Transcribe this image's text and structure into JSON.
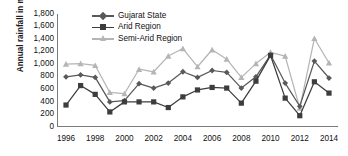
{
  "chart_data": {
    "type": "line",
    "title": "",
    "xlabel": "",
    "ylabel": "Annual rainfall in mm",
    "ylim": [
      0,
      1800
    ],
    "ytick_values": [
      1800,
      1600,
      1400,
      1200,
      1000,
      800,
      600,
      400,
      200,
      0
    ],
    "ytick_labels": [
      "1,800",
      "1,600",
      "1,400",
      "1,200",
      "1,000",
      "800",
      "600",
      "400",
      "200",
      "0"
    ],
    "xlim": [
      1996,
      2014
    ],
    "x": [
      1996,
      1997,
      1998,
      1999,
      2000,
      2001,
      2002,
      2003,
      2004,
      2005,
      2006,
      2007,
      2008,
      2009,
      2010,
      2011,
      2012,
      2013,
      2014
    ],
    "xtick_labels": [
      "1996",
      "1998",
      "2000",
      "2002",
      "2004",
      "2006",
      "2008",
      "2010",
      "2012",
      "2014"
    ],
    "xtick_values": [
      1996,
      1998,
      2000,
      2002,
      2004,
      2006,
      2008,
      2010,
      2012,
      2014
    ],
    "grid": false,
    "legend_position": "top-center",
    "series": [
      {
        "name": "Gujarat State",
        "color": "#595959",
        "marker": "diamond",
        "values": [
          800,
          830,
          790,
          400,
          420,
          690,
          620,
          700,
          880,
          790,
          900,
          870,
          620,
          800,
          1150,
          700,
          330,
          1050,
          780
        ]
      },
      {
        "name": "Arid Region",
        "color": "#3d3d3d",
        "marker": "square",
        "values": [
          350,
          660,
          520,
          240,
          400,
          400,
          400,
          310,
          480,
          590,
          630,
          620,
          380,
          730,
          1140,
          460,
          180,
          720,
          540
        ]
      },
      {
        "name": "Semi-Arid Region",
        "color": "#b5b5b5",
        "marker": "triangle",
        "values": [
          1000,
          1010,
          980,
          550,
          530,
          920,
          880,
          1130,
          1250,
          960,
          1230,
          1080,
          790,
          1010,
          1190,
          1130,
          300,
          1410,
          1020
        ]
      }
    ]
  },
  "legend": {
    "items": [
      {
        "label": "Gujarat State"
      },
      {
        "label": "Arid Region"
      },
      {
        "label": "Semi-Arid Region"
      }
    ]
  }
}
